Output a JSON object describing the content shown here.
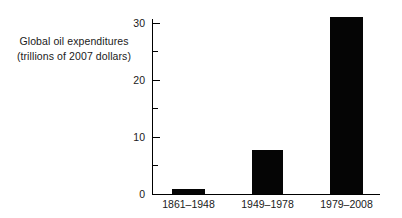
{
  "chart_data": {
    "type": "bar",
    "title": "",
    "xlabel": "",
    "ylabel": "Global oil expenditures (trillions of 2007 dollars)",
    "ylabel_lines": [
      "Global oil expenditures",
      "(trillions of 2007 dollars)"
    ],
    "categories": [
      "1861–1948",
      "1949–1978",
      "1979–2008"
    ],
    "values": [
      0.8,
      7.6,
      30.9
    ],
    "ylim": [
      0,
      31.5
    ],
    "y_ticks_major": [
      0,
      10,
      20,
      30
    ],
    "y_tick_labels": [
      "0",
      "10",
      "20",
      "30"
    ],
    "y_ticks_minor": [
      5,
      15,
      25
    ],
    "grid": false,
    "legend": false,
    "bar_color": "#050505",
    "axis_color": "#000000",
    "text_color": "#1a1a1a",
    "background": "#ffffff"
  },
  "axis": {
    "y_label_line1": "Global oil expenditures",
    "y_label_line2": "(trillions of 2007 dollars)",
    "tick_0": "0",
    "tick_10": "10",
    "tick_20": "20",
    "tick_30": "30"
  },
  "bars": [
    {
      "label": "1861–1948",
      "value": 0.8
    },
    {
      "label": "1949–1978",
      "value": 7.6
    },
    {
      "label": "1979–2008",
      "value": 30.9
    }
  ]
}
